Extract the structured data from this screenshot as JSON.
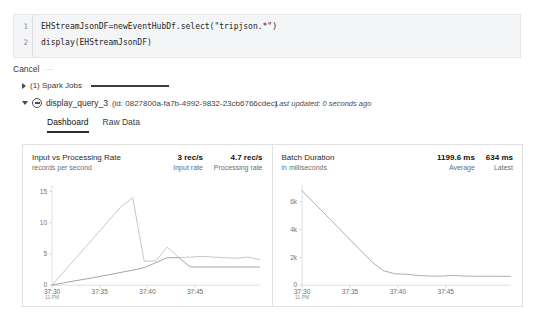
{
  "notebook": {
    "code_lines": [
      {
        "number": "1",
        "text": "EHStreamJsonDF=newEventHubDf.select(\"tripjson.*\")"
      },
      {
        "number": "2",
        "text": "display(EHStreamJsonDF)"
      }
    ],
    "cancel_label": "Cancel",
    "cancel_dots": "···",
    "spark_jobs_label": "(1) Spark Jobs",
    "query_name": "display_query_3",
    "query_id": "(id: 0827800a-fa7b-4992-9832-23cb6766cdec)",
    "last_updated": "Last updated: 0 seconds ago",
    "tabs": [
      {
        "label": "Dashboard",
        "active": true
      },
      {
        "label": "Raw Data",
        "active": false
      }
    ]
  },
  "chart_data": [
    {
      "type": "line",
      "title": "Input vs Processing Rate",
      "subtitle": "records per second",
      "metrics": [
        {
          "value": "3 rec/s",
          "caption": "Input rate"
        },
        {
          "value": "4.7 rec/s",
          "caption": "Processing rate"
        }
      ],
      "ylabel": "records per second",
      "xlabel": "",
      "ylim": [
        0,
        16
      ],
      "yticks": [
        0,
        5,
        10,
        15
      ],
      "ytick_labels": [
        "0",
        "5",
        "10",
        "15"
      ],
      "xticks": [
        "37:30",
        "37:35",
        "37:40",
        "37:45"
      ],
      "xtick_sub": "11 PM",
      "grid": false,
      "legend": "none",
      "x": [
        0,
        1,
        2,
        3,
        4,
        5,
        6,
        7,
        8,
        9,
        10,
        11,
        12,
        13,
        14,
        15,
        16,
        17,
        18
      ],
      "series": [
        {
          "name": "Processing rate",
          "color": "#b9bbbd",
          "values": [
            0,
            2.1,
            4.2,
            6.3,
            8.4,
            10.5,
            12.6,
            14.0,
            3.8,
            3.9,
            6.1,
            4.4,
            4.5,
            4.6,
            4.5,
            4.4,
            4.3,
            4.5,
            4.1
          ]
        },
        {
          "name": "Input rate",
          "color": "#8e9093",
          "values": [
            0,
            0.35,
            0.7,
            1.0,
            1.35,
            1.7,
            2.05,
            2.4,
            2.8,
            3.6,
            4.4,
            4.4,
            2.9,
            2.9,
            2.9,
            2.9,
            2.9,
            2.9,
            2.9
          ]
        }
      ]
    },
    {
      "type": "line",
      "title": "Batch Duration",
      "subtitle": "in milliseconds",
      "metrics": [
        {
          "value": "1199.6 ms",
          "caption": "Average"
        },
        {
          "value": "634 ms",
          "caption": "Latest"
        }
      ],
      "ylabel": "in milliseconds",
      "xlabel": "",
      "ylim": [
        0,
        7200
      ],
      "yticks": [
        0,
        2000,
        4000,
        6000
      ],
      "ytick_labels": [
        "0",
        "2k",
        "4k",
        "6k"
      ],
      "xticks": [
        "37:30",
        "37:35",
        "37:40",
        "37:45"
      ],
      "xtick_sub": "11 PM",
      "grid": false,
      "legend": "none",
      "x": [
        0,
        1,
        2,
        3,
        4,
        5,
        6,
        7,
        8,
        9,
        10,
        11,
        12,
        13,
        14,
        15,
        16,
        17,
        18
      ],
      "series": [
        {
          "name": "Batch duration",
          "color": "#9a9c9e",
          "values": [
            6800,
            5950,
            5100,
            4250,
            3400,
            2550,
            1700,
            1050,
            820,
            790,
            700,
            660,
            650,
            700,
            660,
            640,
            650,
            640,
            634
          ]
        }
      ]
    }
  ]
}
